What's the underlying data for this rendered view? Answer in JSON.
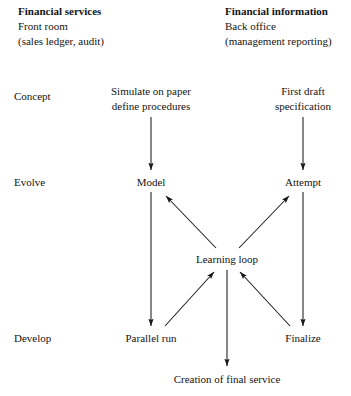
{
  "diagram": {
    "title_columns": [
      {
        "id": "financial-services",
        "heading": "Financial services",
        "line2": "Front room",
        "line3": "(sales ledger, audit)"
      },
      {
        "id": "financial-information",
        "heading": "Financial information",
        "line2": "Back office",
        "line3": "(management reporting)"
      }
    ],
    "stage_labels": [
      {
        "id": "concept",
        "label": "Concept"
      },
      {
        "id": "evolve",
        "label": "Evolve"
      },
      {
        "id": "develop",
        "label": "Develop"
      }
    ],
    "nodes": [
      {
        "id": "simulate-on-paper",
        "line1": "Simulate on paper",
        "line2": "define procedures"
      },
      {
        "id": "first-draft-specification",
        "line1": "First draft",
        "line2": "specification"
      },
      {
        "id": "model",
        "line1": "Model"
      },
      {
        "id": "attempt",
        "line1": "Attempt"
      },
      {
        "id": "learning-loop",
        "line1": "Learning loop"
      },
      {
        "id": "parallel-run",
        "line1": "Parallel run"
      },
      {
        "id": "finalize",
        "line1": "Finalize"
      },
      {
        "id": "creation-of-final-service",
        "line1": "Creation of final service"
      }
    ],
    "edges": [
      {
        "id": "simulate-to-model",
        "from": "simulate-on-paper",
        "to": "model",
        "style": "straight-down"
      },
      {
        "id": "first-draft-to-attempt",
        "from": "first-draft-specification",
        "to": "attempt",
        "style": "straight-down"
      },
      {
        "id": "model-to-parallel-run",
        "from": "model",
        "to": "parallel-run",
        "style": "straight-down"
      },
      {
        "id": "attempt-to-finalize",
        "from": "attempt",
        "to": "finalize",
        "style": "straight-down"
      },
      {
        "id": "learning-loop-to-model",
        "from": "learning-loop",
        "to": "model",
        "style": "diagonal-up-left"
      },
      {
        "id": "learning-loop-to-attempt",
        "from": "learning-loop",
        "to": "attempt",
        "style": "diagonal-up-right"
      },
      {
        "id": "parallel-run-to-learning-loop",
        "from": "parallel-run",
        "to": "learning-loop",
        "style": "diagonal-up-right"
      },
      {
        "id": "finalize-to-learning-loop",
        "from": "finalize",
        "to": "learning-loop",
        "style": "diagonal-up-left"
      },
      {
        "id": "learning-loop-to-creation",
        "from": "learning-loop",
        "to": "creation-of-final-service",
        "style": "straight-down"
      }
    ],
    "colors": {
      "ink": "#141414",
      "background": "#ffffff",
      "line": "#1a1a1a"
    }
  }
}
